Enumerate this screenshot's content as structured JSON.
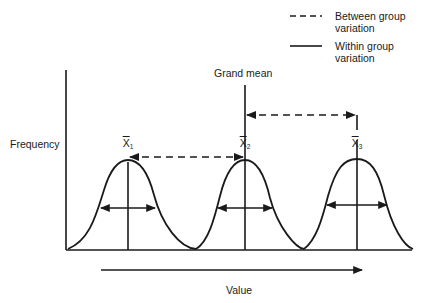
{
  "legend": {
    "between": {
      "label": "Between group variation",
      "line1": "Between group",
      "line2": "variation",
      "style": "dashed"
    },
    "within": {
      "label": "Within group variation",
      "line1": "Within group",
      "line2": "variation",
      "style": "solid"
    }
  },
  "labels": {
    "grand_mean": "Grand mean",
    "y_axis": "Frequency",
    "x_axis": "Value"
  },
  "means": [
    {
      "symbol": "X",
      "subscript": "1"
    },
    {
      "symbol": "X",
      "subscript": "2"
    },
    {
      "symbol": "X",
      "subscript": "3"
    }
  ],
  "colors": {
    "ink": "#1a1a1a",
    "background": "#ffffff"
  }
}
